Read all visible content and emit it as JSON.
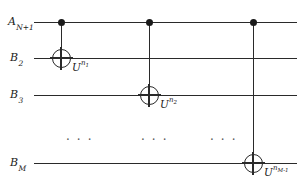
{
  "figure": {
    "type": "quantum-circuit-diagram",
    "width": 301,
    "height": 193,
    "background_color": "#ffffff",
    "line_color": "#2a2a2a"
  },
  "wires": [
    {
      "id": "wire-a",
      "label_base": "A",
      "label_sub": "N+1",
      "y": 22
    },
    {
      "id": "wire-b2",
      "label_base": "B",
      "label_sub": "2",
      "y": 58
    },
    {
      "id": "wire-b3",
      "label_base": "B",
      "label_sub": "3",
      "y": 95
    },
    {
      "id": "wire-bm",
      "label_base": "B",
      "label_sub": "M",
      "y": 163
    }
  ],
  "gates": [
    {
      "id": "gate-1",
      "x": 61,
      "control_y": 22,
      "target_y": 58,
      "label_base": "U",
      "label_sup": "n",
      "label_sup_sub": "1",
      "label_text": "U"
    },
    {
      "id": "gate-2",
      "x": 149,
      "control_y": 22,
      "target_y": 95,
      "label_base": "U",
      "label_sup": "n",
      "label_sup_sub": "2",
      "label_text": "U"
    },
    {
      "id": "gate-3",
      "x": 253,
      "control_y": 22,
      "target_y": 163,
      "label_base": "U",
      "label_sup": "n",
      "label_sup_sub": "M-1",
      "label_text": "U"
    }
  ],
  "ellipses": [
    {
      "id": "ellipsis-1",
      "text": "· · ·",
      "x": 66,
      "y": 134
    },
    {
      "id": "ellipsis-2",
      "text": "· · ·",
      "x": 141,
      "y": 134
    },
    {
      "id": "ellipsis-3",
      "text": "· · ·",
      "x": 210,
      "y": 134
    }
  ],
  "labels": {
    "wire_a": "A",
    "wire_a_sub": "N+1",
    "wire_b2": "B",
    "wire_b2_sub": "2",
    "wire_b3": "B",
    "wire_b3_sub": "3",
    "wire_bm": "B",
    "wire_bm_sub": "M",
    "gate1_base": "U",
    "gate1_sup": "n",
    "gate1_sup_sub": "1",
    "gate2_base": "U",
    "gate2_sup": "n",
    "gate2_sup_sub": "2",
    "gate3_base": "U",
    "gate3_sup": "n",
    "gate3_sup_sub": "M-1"
  }
}
